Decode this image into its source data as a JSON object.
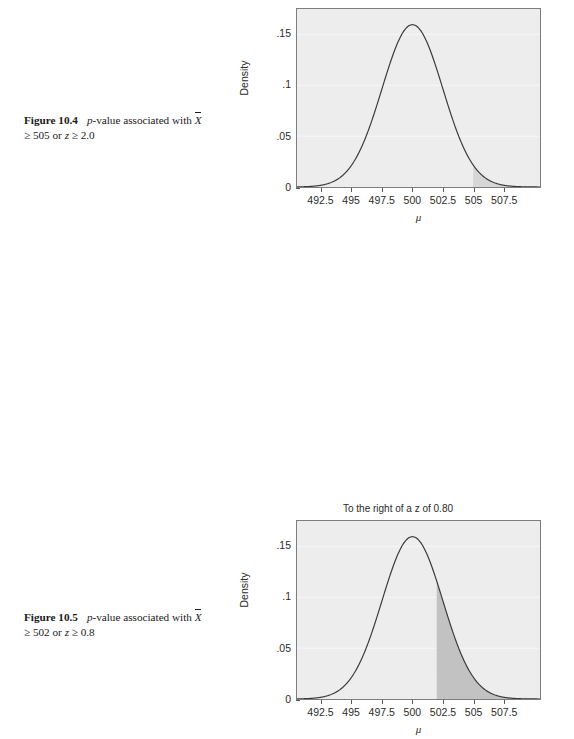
{
  "page": {
    "background": "#ffffff"
  },
  "figures": [
    {
      "id": "figure-10-4",
      "caption": {
        "label": "Figure 10.4",
        "text_1": "p",
        "text_2": "-value associated with ",
        "xbar": "X",
        "text_3": " ≥ 505 or ",
        "zvar": "z",
        "text_4": " ≥ 2.0",
        "full_text": "Figure 10.4  p-value associated with X̄ ≥ 505 or z ≥ 2.0"
      },
      "chart_data": {
        "type": "area",
        "title": "",
        "xlabel": "μ",
        "ylabel": "Density",
        "xlim": [
          490.5,
          510.5
        ],
        "ylim": [
          0,
          0.175
        ],
        "xticks": [
          492.5,
          495,
          497.5,
          500,
          502.5,
          505,
          507.5
        ],
        "xticklabels": [
          "492.5",
          "495",
          "497.5",
          "500",
          "502.5",
          "505",
          "507.5"
        ],
        "yticks": [
          0,
          0.05,
          0.1,
          0.15
        ],
        "yticklabels": [
          "0",
          ".05",
          ".1",
          ".15"
        ],
        "grid": true,
        "distribution": {
          "kind": "normal",
          "mean": 500,
          "sd": 2.5,
          "peak_density": 0.1596
        },
        "shaded_region": {
          "from": 505,
          "to": 510.5,
          "color": "#d6d6d6",
          "label": "p-value tail"
        },
        "curve_color": "#3a3a3a",
        "plot_background": "#ededed",
        "grid_color": "#f7f7f7"
      }
    },
    {
      "id": "figure-10-5",
      "caption": {
        "label": "Figure 10.5",
        "text_1": "p",
        "text_2": "-value associated with ",
        "xbar": "X",
        "text_3": " ≥ 502 or ",
        "zvar": "z",
        "text_4": " ≥ 0.8",
        "full_text": "Figure 10.5  p-value associated with X̄ ≥ 502 or z ≥ 0.8"
      },
      "chart_data": {
        "type": "area",
        "title": "To the right of a z of 0.80",
        "xlabel": "μ",
        "ylabel": "Density",
        "xlim": [
          490.5,
          510.5
        ],
        "ylim": [
          0,
          0.175
        ],
        "xticks": [
          492.5,
          495,
          497.5,
          500,
          502.5,
          505,
          507.5
        ],
        "xticklabels": [
          "492.5",
          "495",
          "497.5",
          "500",
          "502.5",
          "505",
          "507.5"
        ],
        "yticks": [
          0,
          0.05,
          0.1,
          0.15
        ],
        "yticklabels": [
          "0",
          ".05",
          ".1",
          ".15"
        ],
        "grid": true,
        "distribution": {
          "kind": "normal",
          "mean": 500,
          "sd": 2.5,
          "peak_density": 0.1596
        },
        "shaded_region": {
          "from": 502,
          "to": 510.5,
          "color": "#c2c2c2",
          "label": "p-value tail"
        },
        "curve_color": "#3a3a3a",
        "plot_background": "#ededed",
        "grid_color": "#f7f7f7"
      }
    }
  ]
}
